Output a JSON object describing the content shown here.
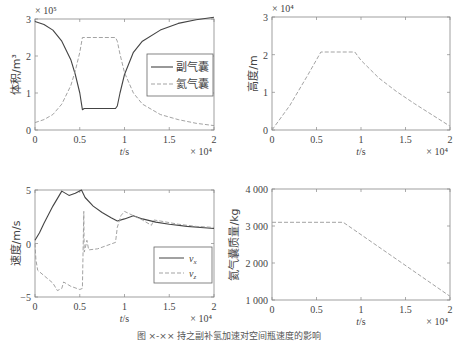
{
  "caption": "图 ×-×× 持之副补氢加速对空间瓶速度的影响",
  "colors": {
    "solid": "#444444",
    "dashed": "#999999",
    "frame": "#888888"
  },
  "chart_data": [
    {
      "id": "volume",
      "type": "line",
      "title": "",
      "xlabel": "t/s",
      "ylabel": "体积/m³",
      "x_multiplier": "× 10⁴",
      "y_multiplier": "× 10⁵",
      "xlim": [
        0,
        2
      ],
      "ylim": [
        0,
        3
      ],
      "xticks": [
        "0",
        "0.5",
        "1",
        "1.5",
        "2"
      ],
      "yticks": [
        "0",
        "1",
        "2",
        "3"
      ],
      "legend_position": "right-middle",
      "series": [
        {
          "name": "副气囊",
          "style": "solid",
          "x": [
            0,
            0.1,
            0.2,
            0.3,
            0.4,
            0.45,
            0.5,
            0.53,
            0.55,
            0.9,
            0.92,
            0.95,
            1.0,
            1.1,
            1.2,
            1.4,
            1.6,
            1.8,
            2.0
          ],
          "y": [
            2.93,
            2.85,
            2.7,
            2.4,
            1.9,
            1.5,
            1.0,
            0.55,
            0.58,
            0.58,
            0.65,
            1.0,
            1.5,
            2.1,
            2.4,
            2.7,
            2.88,
            2.98,
            3.05
          ]
        },
        {
          "name": "氦气囊",
          "style": "dashed",
          "x": [
            0,
            0.1,
            0.2,
            0.3,
            0.4,
            0.45,
            0.5,
            0.53,
            0.55,
            0.9,
            0.92,
            0.95,
            1.0,
            1.1,
            1.2,
            1.4,
            1.6,
            1.8,
            2.0
          ],
          "y": [
            0.2,
            0.28,
            0.42,
            0.7,
            1.2,
            1.6,
            2.1,
            2.5,
            2.5,
            2.5,
            2.4,
            2.05,
            1.55,
            1.0,
            0.7,
            0.42,
            0.28,
            0.18,
            0.12
          ]
        }
      ]
    },
    {
      "id": "altitude",
      "type": "line",
      "xlabel": "t/s",
      "ylabel": "高度/m",
      "x_multiplier": "× 10⁴",
      "y_multiplier": "× 10⁴",
      "xlim": [
        0,
        2
      ],
      "ylim": [
        0,
        3
      ],
      "xticks": [
        "0",
        "0.5",
        "1",
        "1.5",
        "2"
      ],
      "yticks": [
        "0",
        "1",
        "2",
        "3"
      ],
      "series": [
        {
          "name": "高度",
          "style": "dashed",
          "x": [
            0,
            0.2,
            0.4,
            0.55,
            0.93,
            1.0,
            1.2,
            1.4,
            1.6,
            1.8,
            2.0
          ],
          "y": [
            0,
            0.65,
            1.45,
            2.07,
            2.07,
            1.85,
            1.38,
            1.02,
            0.7,
            0.4,
            0.1
          ]
        }
      ]
    },
    {
      "id": "velocity",
      "type": "line",
      "xlabel": "t/s",
      "ylabel": "速度/m/s",
      "x_multiplier": "× 10⁴",
      "xlim": [
        0,
        2
      ],
      "ylim": [
        -5,
        5
      ],
      "xticks": [
        "0",
        "0.5",
        "1",
        "1.5",
        "2"
      ],
      "yticks": [
        "-5",
        "0",
        "5"
      ],
      "legend_position": "right-lower",
      "series": [
        {
          "name": "v_x",
          "style": "solid",
          "x": [
            0,
            0.05,
            0.1,
            0.2,
            0.3,
            0.38,
            0.45,
            0.52,
            0.56,
            0.65,
            0.75,
            0.85,
            0.92,
            1.0,
            1.1,
            1.2,
            1.35,
            1.5,
            1.7,
            2.0
          ],
          "y": [
            0.3,
            1.0,
            1.9,
            3.5,
            4.9,
            4.5,
            4.7,
            5.0,
            4.3,
            3.5,
            2.9,
            2.4,
            2.1,
            2.3,
            2.6,
            2.3,
            2.0,
            1.8,
            1.6,
            1.4
          ]
        },
        {
          "name": "v_z",
          "style": "dashed",
          "x": [
            0,
            0.01,
            0.03,
            0.1,
            0.2,
            0.25,
            0.3,
            0.32,
            0.4,
            0.5,
            0.53,
            0.545,
            0.55,
            0.56,
            0.58,
            0.6,
            0.7,
            0.9,
            0.92,
            0.96,
            1.0,
            1.1,
            1.2,
            1.3,
            1.33,
            1.4,
            1.6,
            1.8,
            2.0
          ],
          "y": [
            0,
            -1.5,
            -2.5,
            -3.0,
            -3.7,
            -4.4,
            -4.2,
            -3.6,
            -4.0,
            -4.3,
            -4.2,
            3.0,
            -0.8,
            -0.5,
            0.3,
            -0.6,
            -0.5,
            0.1,
            1.5,
            2.6,
            3.0,
            2.6,
            2.2,
            1.7,
            2.2,
            2.1,
            1.8,
            1.6,
            1.5
          ]
        }
      ]
    },
    {
      "id": "helium_mass",
      "type": "line",
      "xlabel": "t/s",
      "ylabel": "氦气囊质量/kg",
      "x_multiplier": "× 10⁴",
      "xlim": [
        0,
        2
      ],
      "ylim": [
        1000,
        4000
      ],
      "xticks": [
        "0",
        "0.5",
        "1",
        "1.5",
        "2"
      ],
      "yticks": [
        "1 000",
        "2 000",
        "3 000",
        "4 000"
      ],
      "series": [
        {
          "name": "氦气囊质量",
          "style": "dashed",
          "x": [
            0,
            0.8,
            2.0
          ],
          "y": [
            3100,
            3100,
            1100
          ]
        }
      ]
    }
  ],
  "legend": {
    "volume": [
      "副气囊",
      "氦气囊"
    ],
    "velocity_main": [
      "v",
      "v"
    ],
    "velocity_sub": [
      "x",
      "z"
    ]
  }
}
